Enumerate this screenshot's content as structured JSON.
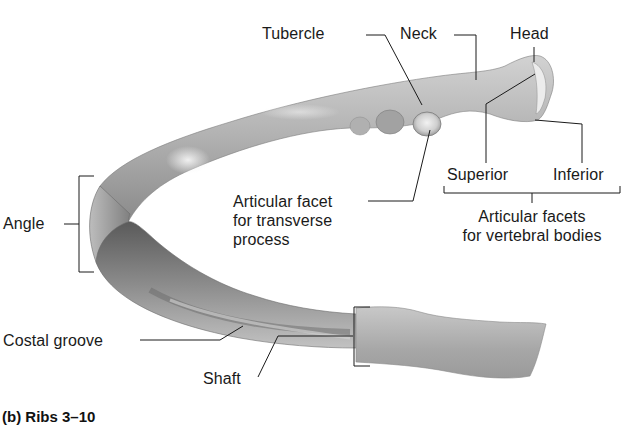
{
  "figure": {
    "caption": "(b) Ribs 3–10",
    "subject": "rib",
    "colors": {
      "background": "#ffffff",
      "bone_light": "#d8d8d8",
      "bone_mid": "#a9a9a9",
      "bone_dark": "#5e5e5e",
      "leader_line": "#1a1a1a",
      "text": "#1a1a1a"
    }
  },
  "labels": {
    "tubercle": "Tubercle",
    "neck": "Neck",
    "head": "Head",
    "superior": "Superior",
    "inferior": "Inferior",
    "articular_facet_transverse": [
      "Articular facet",
      "for transverse",
      "process"
    ],
    "articular_facets_vertebral": [
      "Articular facets",
      "for vertebral bodies"
    ],
    "angle": "Angle",
    "costal_groove": "Costal groove",
    "shaft": "Shaft"
  }
}
